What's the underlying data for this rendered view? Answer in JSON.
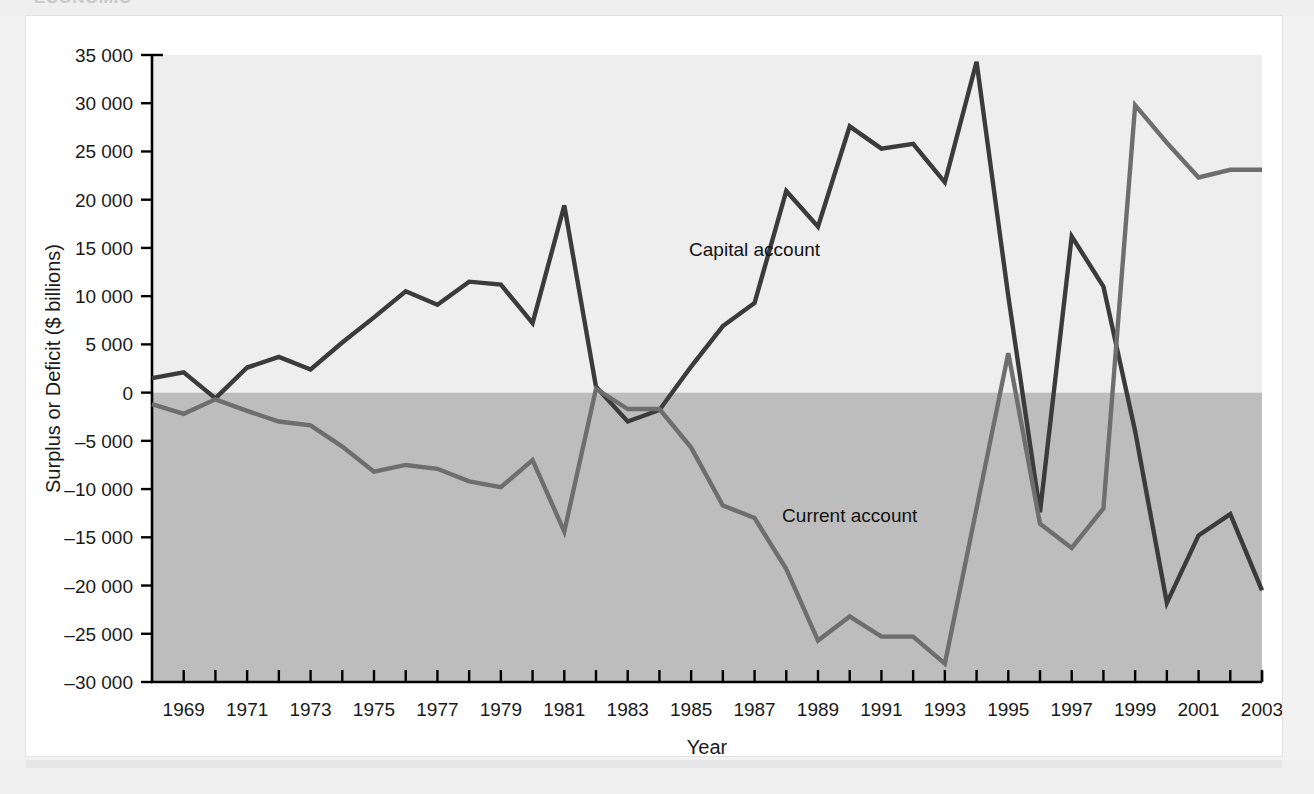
{
  "page": {
    "cropped_heading": "ECONOMIC"
  },
  "chart_data": {
    "type": "line",
    "title": "",
    "xlabel": "Year",
    "ylabel": "Surplus or Deficit ($ billions)",
    "xlim": [
      1968,
      2003
    ],
    "ylim": [
      -30000,
      35000
    ],
    "ytick_step": 5000,
    "ytick_labels": [
      "35 000",
      "30 000",
      "25 000",
      "20 000",
      "15 000",
      "10 000",
      "5 000",
      "0",
      "–5 000",
      "–10 000",
      "–15 000",
      "–20 000",
      "–25 000",
      "–30 000"
    ],
    "ytick_values": [
      35000,
      30000,
      25000,
      20000,
      15000,
      10000,
      5000,
      0,
      -5000,
      -10000,
      -15000,
      -20000,
      -25000,
      -30000
    ],
    "xtick_labels": [
      "1969",
      "1971",
      "1973",
      "1975",
      "1977",
      "1979",
      "1981",
      "1983",
      "1985",
      "1987",
      "1989",
      "1991",
      "1993",
      "1995",
      "1997",
      "1999",
      "2001",
      "2003"
    ],
    "xtick_values": [
      1969,
      1971,
      1973,
      1975,
      1977,
      1979,
      1981,
      1983,
      1985,
      1987,
      1989,
      1991,
      1993,
      1995,
      1997,
      1999,
      2001,
      2003
    ],
    "minor_ticks_every": 1,
    "grid": false,
    "legend": "inline-annotations",
    "background_positive": "#eeeeee",
    "background_negative": "#bdbdbd",
    "x": [
      1968,
      1969,
      1970,
      1971,
      1972,
      1973,
      1974,
      1975,
      1976,
      1977,
      1978,
      1979,
      1980,
      1981,
      1982,
      1983,
      1984,
      1985,
      1986,
      1987,
      1988,
      1989,
      1990,
      1991,
      1992,
      1993,
      1994,
      1995,
      1996,
      1997,
      1998,
      1999,
      2000,
      2001,
      2002,
      2003
    ],
    "series": [
      {
        "name": "Capital account",
        "color": "#3b3b3b",
        "values": [
          1500,
          2100,
          -600,
          2600,
          3700,
          2400,
          5200,
          7800,
          10500,
          9100,
          11500,
          11200,
          7200,
          19400,
          600,
          -3000,
          -1800,
          2700,
          6900,
          9300,
          20900,
          17200,
          27600,
          25300,
          25800,
          21800,
          34300,
          10000,
          -12400,
          16200,
          11000,
          -4000,
          -21800,
          -14800,
          -12600,
          -20500
        ]
      },
      {
        "name": "Current account",
        "color": "#6e6e6e",
        "values": [
          -1200,
          -2200,
          -700,
          -1900,
          -3000,
          -3400,
          -5600,
          -8200,
          -7500,
          -7900,
          -9200,
          -9800,
          -7000,
          -14400,
          400,
          -1700,
          -1700,
          -5700,
          -11700,
          -13000,
          -18300,
          -25700,
          -23200,
          -25300,
          -25300,
          -28100,
          -12000,
          4100,
          -13600,
          -16100,
          -12000,
          29800,
          25900,
          22300,
          23100,
          23100
        ]
      }
    ],
    "annotations": [
      {
        "text": "Capital account",
        "x": 1987,
        "y": 14200
      },
      {
        "text": "Current account",
        "x": 1990,
        "y": -13400
      }
    ]
  }
}
